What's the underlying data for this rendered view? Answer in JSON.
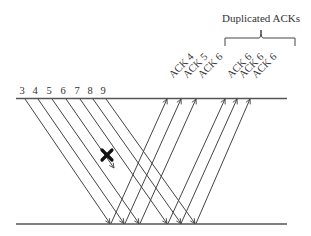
{
  "diagram": {
    "title_annotation": "Duplicated ACKs",
    "colors": {
      "line": "#444444",
      "text": "#333333",
      "loss_mark": "#111111"
    },
    "timeline": {
      "top_y": 98.5,
      "bottom_y": 224,
      "x_start": 16,
      "x_end": 287
    },
    "packets": [
      {
        "label": "3",
        "x_top": 25,
        "x_bottom": 110,
        "lost": false
      },
      {
        "label": "4",
        "x_top": 38,
        "x_bottom": 124,
        "lost": false
      },
      {
        "label": "5",
        "x_top": 52,
        "x_bottom": 139,
        "lost": false
      },
      {
        "label": "6",
        "x_top": 66,
        "x_bottom": 153,
        "lost": true,
        "loss_x": 107,
        "loss_y": 155,
        "end_x": 114,
        "end_y": 168
      },
      {
        "label": "7",
        "x_top": 80,
        "x_bottom": 167,
        "lost": false
      },
      {
        "label": "8",
        "x_top": 93,
        "x_bottom": 181,
        "lost": false
      },
      {
        "label": "9",
        "x_top": 106,
        "x_bottom": 195,
        "lost": false
      }
    ],
    "acks": [
      {
        "label": "ACK 4",
        "x_bottom": 111,
        "x_top": 167,
        "duplicate": false
      },
      {
        "label": "ACK 5",
        "x_bottom": 125,
        "x_top": 181,
        "duplicate": false
      },
      {
        "label": "ACK 6",
        "x_bottom": 140,
        "x_top": 196,
        "duplicate": false
      },
      {
        "label": "ACK 6",
        "x_bottom": 168,
        "x_top": 225,
        "duplicate": true
      },
      {
        "label": "ACK 6",
        "x_bottom": 181,
        "x_top": 237,
        "duplicate": true
      },
      {
        "label": "ACK 6",
        "x_bottom": 196,
        "x_top": 250,
        "duplicate": true
      }
    ],
    "brace": {
      "x_left": 225,
      "x_right": 295,
      "y_line": 38,
      "y_ends": 46,
      "x_mid": 261,
      "y_tip": 30
    }
  }
}
